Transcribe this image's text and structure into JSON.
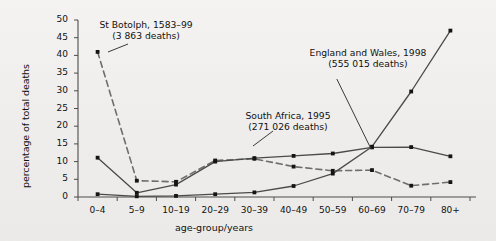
{
  "chart_data": {
    "type": "line",
    "title": "",
    "xlabel": "age-group/years",
    "ylabel": "percentage of total deaths",
    "categories": [
      "0–4",
      "5–9",
      "10–19",
      "20–29",
      "30–39",
      "40–49",
      "50–59",
      "60–69",
      "70–79",
      "80+"
    ],
    "ylim": [
      0,
      50
    ],
    "yticks": [
      0,
      5,
      10,
      15,
      20,
      25,
      30,
      35,
      40,
      45,
      50
    ],
    "ytick_labels": [
      "0",
      "5",
      "10",
      "15",
      "20",
      "25",
      "30",
      "35",
      "40",
      "45",
      "50"
    ],
    "grid": false,
    "legend": "annotations",
    "series": [
      {
        "name": "St Botolph, 1583–99",
        "style": "dashed",
        "color": "#6e6e6e",
        "marker": "square",
        "values": [
          41.0,
          4.6,
          4.3,
          10.3,
          10.8,
          8.6,
          7.4,
          7.6,
          3.2,
          4.2
        ]
      },
      {
        "name": "South Africa, 1995",
        "style": "solid",
        "color": "#4a4a4a",
        "marker": "square",
        "values": [
          11.1,
          1.2,
          3.5,
          10.0,
          11.0,
          11.6,
          12.3,
          14.0,
          14.1,
          11.5
        ]
      },
      {
        "name": "England and Wales, 1998",
        "style": "solid",
        "color": "#4a4a4a",
        "marker": "square",
        "values": [
          0.8,
          0.2,
          0.3,
          0.8,
          1.3,
          3.1,
          6.6,
          14.2,
          29.8,
          47.0
        ]
      }
    ],
    "annotations": [
      {
        "id": "st-botolph",
        "line1": "St Botolph, 1583–99",
        "line2": "(3 863 deaths)"
      },
      {
        "id": "england-wales",
        "line1": "England and Wales, 1998",
        "line2": "(555 015 deaths)"
      },
      {
        "id": "south-africa",
        "line1": "South Africa, 1995",
        "line2": "(271 026 deaths)"
      }
    ]
  }
}
